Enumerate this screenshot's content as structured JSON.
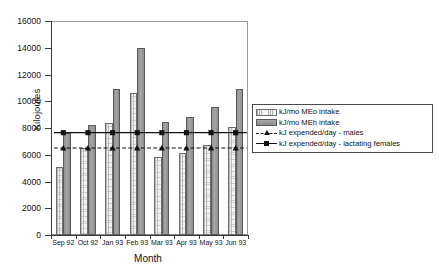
{
  "chart_data": {
    "type": "bar",
    "title": "",
    "xlabel": "Month",
    "ylabel": "Kilojoules",
    "ylim": [
      0,
      16000
    ],
    "ytick_step": 2000,
    "yticks": [
      0,
      2000,
      4000,
      6000,
      8000,
      10000,
      12000,
      14000,
      16000
    ],
    "ytick_labels": [
      "0",
      "2000",
      "4000",
      "6000",
      "8000",
      "10000",
      "12000",
      "14000",
      "16000"
    ],
    "grid": false,
    "legend_position": "right",
    "categories": [
      "Sep 92",
      "Oct 92",
      "Jan 93",
      "Feb 93",
      "Mar 93",
      "Apr 93",
      "May 93",
      "Jun 93"
    ],
    "series": [
      {
        "name": "kJ/mo MEo intake",
        "kind": "bar",
        "fill": "light-dotted",
        "values": [
          5050,
          6480,
          8400,
          10600,
          5800,
          6120,
          6720,
          8050
        ]
      },
      {
        "name": "kJ/mo MEh intake",
        "kind": "bar",
        "fill": "dark-gray",
        "values": [
          7600,
          8200,
          10900,
          13950,
          8450,
          8850,
          9550,
          10950
        ]
      },
      {
        "name": "kJ expended/day - males",
        "kind": "line",
        "style": "dashed",
        "marker": "triangle",
        "values": [
          6500,
          6500,
          6500,
          6500,
          6500,
          6500,
          6500,
          6500
        ]
      },
      {
        "name": "kJ expended/day - lactating females",
        "kind": "line",
        "style": "solid",
        "marker": "square",
        "values": [
          7650,
          7650,
          7650,
          7650,
          7650,
          7650,
          7650,
          7650
        ]
      }
    ]
  },
  "legend": {
    "items": [
      {
        "label": "kJ/mo MEo intake",
        "swatch": "meo"
      },
      {
        "label": "kJ/mo MEh intake",
        "swatch": "meh"
      },
      {
        "label": "kJ expended/day - males",
        "swatch": "dashed-triangle"
      },
      {
        "label": "kJ expended/day - lactating females",
        "swatch": "solid-square"
      }
    ]
  }
}
